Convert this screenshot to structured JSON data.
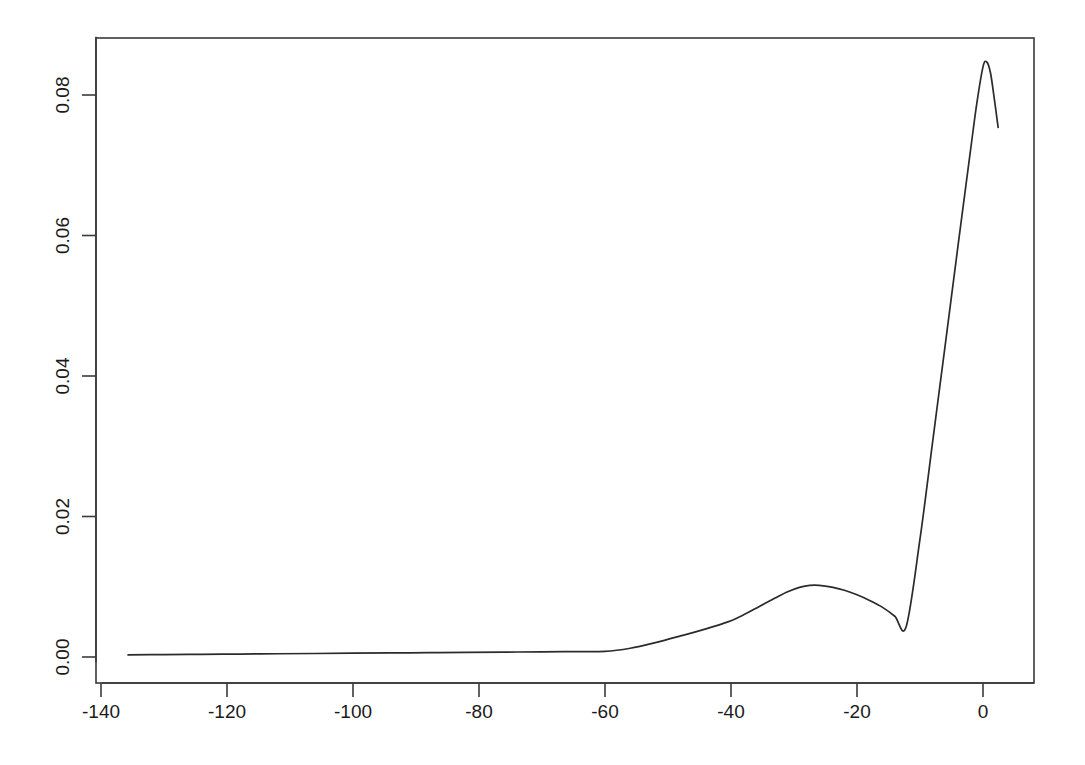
{
  "chart_data": {
    "type": "line",
    "title": "",
    "subtitle": "",
    "xlabel": "",
    "ylabel": "",
    "xlim": [
      -139.9,
      8.1
    ],
    "ylim": [
      -0.0007,
      0.0883
    ],
    "grid": false,
    "legend": null,
    "annotations": [],
    "x_ticks": [
      -140,
      -120,
      -100,
      -80,
      -60,
      -40,
      -20,
      0
    ],
    "x_tick_labels": [
      "-140",
      "-120",
      "-100",
      "-80",
      "-60",
      "-40",
      "-20",
      "0"
    ],
    "y_ticks": [
      0.0,
      0.02,
      0.04,
      0.06,
      0.08
    ],
    "y_tick_labels": [
      "0.00",
      "0.02",
      "0.04",
      "0.06",
      "0.08"
    ],
    "series": [
      {
        "name": "density",
        "color": "#2b2b2b",
        "x": [
          -135.7,
          -130.0,
          -124.0,
          -118.0,
          -112.0,
          -106.0,
          -100.0,
          -94.0,
          -88.0,
          -82.0,
          -76.0,
          -70.0,
          -65.0,
          -60.0,
          -56.0,
          -52.0,
          -48.0,
          -44.0,
          -40.5,
          -38.0,
          -35.5,
          -33.0,
          -31.0,
          -29.0,
          -27.5,
          -26.0,
          -24.0,
          -22.0,
          -20.0,
          -18.0,
          -16.0,
          -14.0,
          -12.2,
          -10.0,
          -8.0,
          -6.0,
          -4.0,
          -2.0,
          -1.0,
          0.0,
          0.6,
          1.2,
          1.8,
          2.4
        ],
        "y": [
          0.0003,
          0.00034,
          0.00038,
          0.00042,
          0.00046,
          0.0005,
          0.00054,
          0.00058,
          0.00062,
          0.00066,
          0.0007,
          0.00074,
          0.00077,
          0.0008,
          0.00125,
          0.00205,
          0.003,
          0.004,
          0.005,
          0.006,
          0.0072,
          0.0084,
          0.0093,
          0.00995,
          0.0102,
          0.0102,
          0.00995,
          0.0095,
          0.00885,
          0.00805,
          0.0071,
          0.0058,
          0.0043,
          0.0168,
          0.0306,
          0.0444,
          0.0583,
          0.072,
          0.0787,
          0.084,
          0.0847,
          0.0831,
          0.0794,
          0.0754
        ]
      }
    ]
  },
  "axes": {
    "frame_color": "#3a3a3a",
    "tick_color": "#3a3a3a",
    "background": "#ffffff"
  }
}
